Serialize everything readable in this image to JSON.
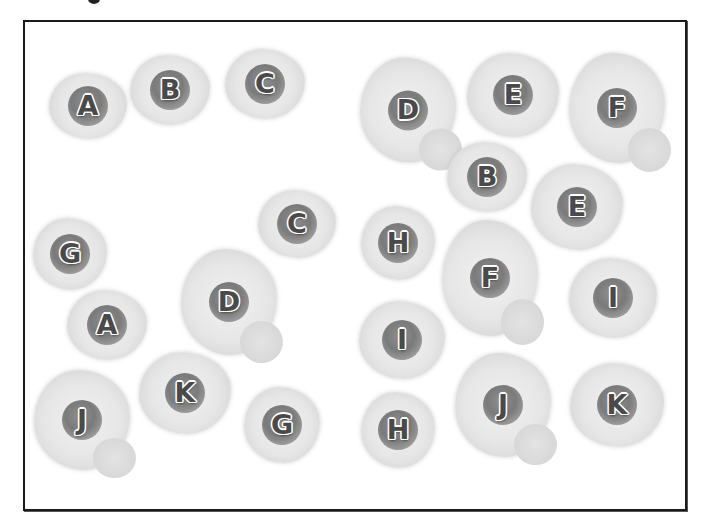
{
  "game": {
    "type": "memory-matching-board",
    "background_color": "#ffffff",
    "border_color": "#1a1a1a",
    "letter_color": "#4a4a4a",
    "yolk_color": "#7a7a7a",
    "white_color": "#e6e6e6"
  },
  "eggs": [
    {
      "letter": "A",
      "x": 88,
      "y": 106,
      "w": 78,
      "h": 66,
      "lumpy": false
    },
    {
      "letter": "B",
      "x": 170,
      "y": 90,
      "w": 80,
      "h": 70,
      "lumpy": false
    },
    {
      "letter": "C",
      "x": 265,
      "y": 84,
      "w": 80,
      "h": 70,
      "lumpy": false
    },
    {
      "letter": "D",
      "x": 408,
      "y": 110,
      "w": 96,
      "h": 105,
      "lumpy": true
    },
    {
      "letter": "E",
      "x": 513,
      "y": 95,
      "w": 92,
      "h": 84,
      "lumpy": false
    },
    {
      "letter": "F",
      "x": 617,
      "y": 108,
      "w": 96,
      "h": 110,
      "lumpy": true
    },
    {
      "letter": "B",
      "x": 487,
      "y": 177,
      "w": 80,
      "h": 70,
      "lumpy": false
    },
    {
      "letter": "E",
      "x": 577,
      "y": 207,
      "w": 92,
      "h": 86,
      "lumpy": false
    },
    {
      "letter": "C",
      "x": 297,
      "y": 224,
      "w": 78,
      "h": 68,
      "lumpy": false
    },
    {
      "letter": "H",
      "x": 398,
      "y": 243,
      "w": 74,
      "h": 74,
      "lumpy": false
    },
    {
      "letter": "G",
      "x": 70,
      "y": 254,
      "w": 74,
      "h": 72,
      "lumpy": false
    },
    {
      "letter": "F",
      "x": 490,
      "y": 278,
      "w": 96,
      "h": 116,
      "lumpy": true
    },
    {
      "letter": "D",
      "x": 229,
      "y": 302,
      "w": 96,
      "h": 106,
      "lumpy": true
    },
    {
      "letter": "I",
      "x": 613,
      "y": 298,
      "w": 88,
      "h": 80,
      "lumpy": false
    },
    {
      "letter": "A",
      "x": 107,
      "y": 325,
      "w": 80,
      "h": 70,
      "lumpy": false
    },
    {
      "letter": "I",
      "x": 402,
      "y": 340,
      "w": 86,
      "h": 78,
      "lumpy": false
    },
    {
      "letter": "K",
      "x": 185,
      "y": 393,
      "w": 92,
      "h": 82,
      "lumpy": false
    },
    {
      "letter": "J",
      "x": 82,
      "y": 420,
      "w": 96,
      "h": 100,
      "lumpy": true
    },
    {
      "letter": "G",
      "x": 282,
      "y": 425,
      "w": 76,
      "h": 76,
      "lumpy": false
    },
    {
      "letter": "H",
      "x": 398,
      "y": 430,
      "w": 74,
      "h": 76,
      "lumpy": false
    },
    {
      "letter": "J",
      "x": 503,
      "y": 405,
      "w": 96,
      "h": 104,
      "lumpy": true
    },
    {
      "letter": "K",
      "x": 617,
      "y": 405,
      "w": 94,
      "h": 84,
      "lumpy": false
    }
  ]
}
